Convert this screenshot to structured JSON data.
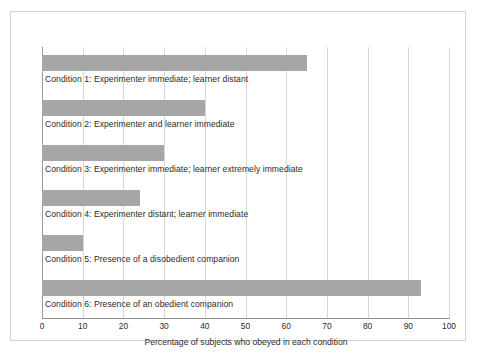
{
  "chart_data": {
    "type": "bar",
    "orientation": "horizontal",
    "title": "",
    "xlabel": "Percentage of subjects who obeyed in each condition",
    "ylabel": "",
    "xlim": [
      0,
      100
    ],
    "xticks": [
      "0",
      "10",
      "20",
      "30",
      "40",
      "50",
      "60",
      "70",
      "80",
      "90",
      "100"
    ],
    "grid": true,
    "legend": false,
    "bar_color": "#a6a6a6",
    "categories": [
      "Condition 1: Experimenter immediate; learner distant",
      "Condition 2: Experimenter and learner immediate",
      "Condition 3: Experimenter immediate; learner extremely immediate",
      "Condition 4: Experimenter distant; learner immediate",
      "Condition 5: Presence of a disobedient companion",
      "Condition 6: Presence of an obedient companion"
    ],
    "values": [
      65,
      40,
      30,
      24,
      10,
      93
    ]
  },
  "colors": {
    "bar": "#a6a6a6",
    "gridline": "#d8d8d8",
    "axis": "#8f8f8f",
    "frame": "#d2d2d2",
    "text": "#2b2b2b",
    "background": "#ffffff"
  }
}
